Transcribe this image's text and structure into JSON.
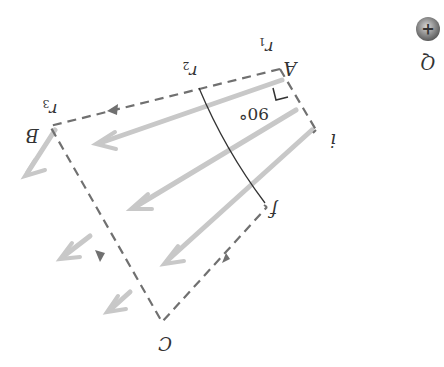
{
  "diagram": {
    "orientation": "rotated 180 degrees",
    "charge": {
      "label": "Q",
      "sign": "+"
    },
    "points": {
      "A": "A",
      "B": "B",
      "C": "C",
      "i": "i",
      "f": "f"
    },
    "radii": {
      "r1": "r",
      "r1_sub": "1",
      "r2": "r",
      "r2_sub": "2",
      "r3": "r",
      "r3_sub": "3"
    },
    "angle_label": "90°",
    "colors": {
      "field_arrows": "#c4c4c4",
      "path": "#707070",
      "arc": "#333333",
      "charge": "#7a7a7a"
    }
  }
}
